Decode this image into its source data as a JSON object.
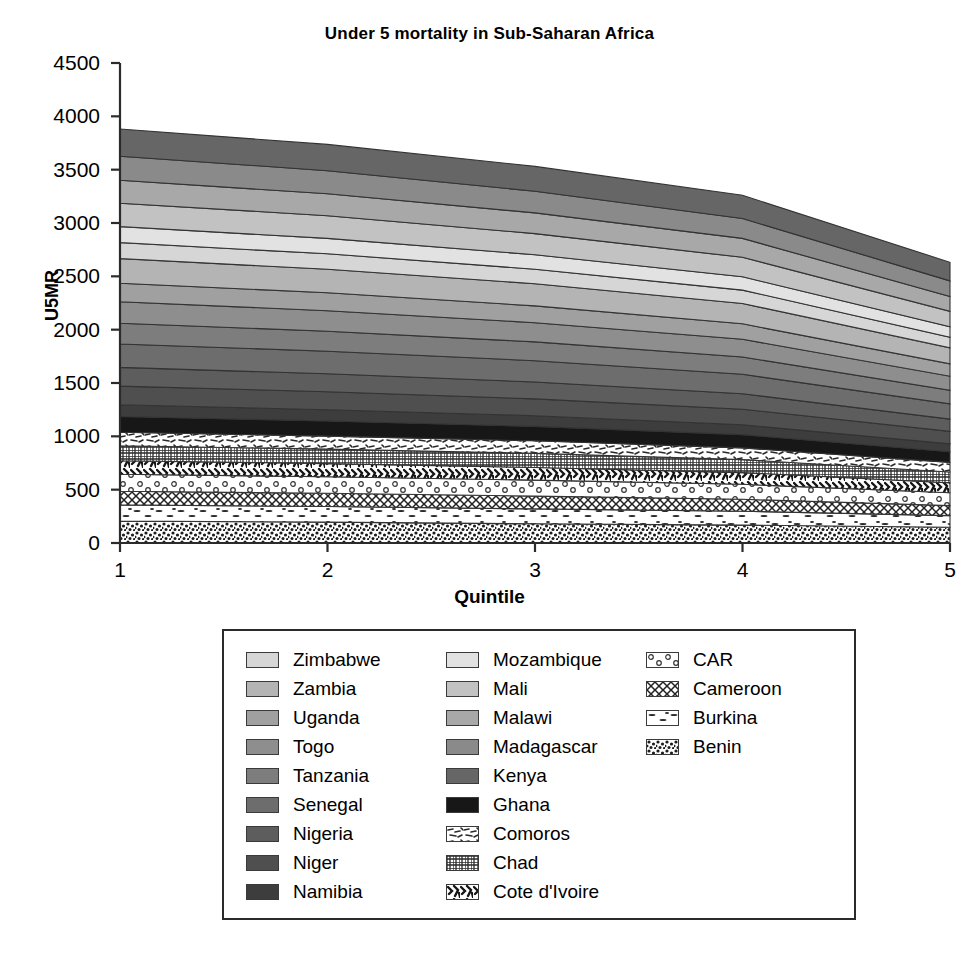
{
  "chart_data": {
    "type": "area",
    "title": "Under 5 mortality in Sub-Saharan Africa",
    "xlabel": "Quintile",
    "ylabel": "U5MR",
    "x": [
      1,
      2,
      3,
      4,
      5
    ],
    "xticklabels": [
      "1",
      "2",
      "3",
      "4",
      "5"
    ],
    "yticklabels": [
      "0",
      "500",
      "1000",
      "1500",
      "2000",
      "2500",
      "3000",
      "3500",
      "4000",
      "4500"
    ],
    "ylim": [
      0,
      4500
    ],
    "xlim": [
      1,
      5
    ],
    "ytick_step": 500,
    "grid": false,
    "legend_position": "below-plot",
    "stacked": true,
    "stack_order_bottom_to_top": [
      "Benin",
      "Burkina",
      "Cameroon",
      "CAR",
      "Cote d'Ivoire",
      "Chad",
      "Comoros",
      "Ghana",
      "Namibia",
      "Niger",
      "Nigeria",
      "Senegal",
      "Tanzania",
      "Togo",
      "Uganda",
      "Zambia",
      "Zimbabwe",
      "Mozambique",
      "Mali",
      "Malawi",
      "Madagascar",
      "Kenya"
    ],
    "series": [
      {
        "name": "Benin",
        "fill": "speckle-dense",
        "color": "#ffffff",
        "values": [
          205,
          196,
          180,
          168,
          147
        ]
      },
      {
        "name": "Burkina",
        "fill": "dash-sparse",
        "color": "#ffffff",
        "values": [
          152,
          146,
          140,
          130,
          110
        ]
      },
      {
        "name": "Cameroon",
        "fill": "crosshatch",
        "color": "#ffffff",
        "values": [
          128,
          124,
          120,
          112,
          94
        ]
      },
      {
        "name": "CAR",
        "fill": "circles",
        "color": "#ffffff",
        "values": [
          160,
          155,
          150,
          140,
          120
        ]
      },
      {
        "name": "Cote d'Ivoire",
        "fill": "squiggle-bold",
        "color": "#ffffff",
        "values": [
          127,
          123,
          118,
          110,
          93
        ]
      },
      {
        "name": "Chad",
        "fill": "grid-fine",
        "color": "#ffffff",
        "values": [
          140,
          136,
          132,
          122,
          102
        ]
      },
      {
        "name": "Comoros",
        "fill": "squiggle-light",
        "color": "#ffffff",
        "values": [
          126,
          122,
          118,
          110,
          90
        ]
      },
      {
        "name": "Ghana",
        "fill": "solid",
        "color": "#171717",
        "values": [
          148,
          142,
          135,
          124,
          100
        ]
      },
      {
        "name": "Namibia",
        "fill": "solid",
        "color": "#3d3d3d",
        "values": [
          110,
          106,
          100,
          92,
          74
        ]
      },
      {
        "name": "Niger",
        "fill": "solid",
        "color": "#4f4f4f",
        "values": [
          175,
          168,
          158,
          146,
          116
        ]
      },
      {
        "name": "Nigeria",
        "fill": "solid",
        "color": "#5d5d5d",
        "values": [
          175,
          168,
          158,
          146,
          116
        ]
      },
      {
        "name": "Senegal",
        "fill": "solid",
        "color": "#6d6d6d",
        "values": [
          220,
          212,
          200,
          182,
          142
        ]
      },
      {
        "name": "Tanzania",
        "fill": "solid",
        "color": "#7d7d7d",
        "values": [
          195,
          188,
          176,
          162,
          128
        ]
      },
      {
        "name": "Togo",
        "fill": "solid",
        "color": "#8e8e8e",
        "values": [
          200,
          192,
          180,
          166,
          132
        ]
      },
      {
        "name": "Uganda",
        "fill": "solid",
        "color": "#a0a0a0",
        "values": [
          175,
          168,
          158,
          145,
          115
        ]
      },
      {
        "name": "Zambia",
        "fill": "solid",
        "color": "#b4b4b4",
        "values": [
          230,
          220,
          208,
          190,
          150
        ]
      },
      {
        "name": "Zimbabwe",
        "fill": "solid",
        "color": "#d6d6d6",
        "values": [
          150,
          145,
          136,
          126,
          100
        ]
      },
      {
        "name": "Mozambique",
        "fill": "solid",
        "color": "#e2e2e2",
        "values": [
          150,
          145,
          136,
          125,
          98
        ]
      },
      {
        "name": "Mali",
        "fill": "solid",
        "color": "#c2c2c2",
        "values": [
          220,
          212,
          198,
          182,
          144
        ]
      },
      {
        "name": "Malawi",
        "fill": "solid",
        "color": "#a8a8a8",
        "values": [
          215,
          206,
          194,
          178,
          140
        ]
      },
      {
        "name": "Madagascar",
        "fill": "solid",
        "color": "#8a8a8a",
        "values": [
          225,
          216,
          202,
          186,
          146
        ]
      },
      {
        "name": "Kenya",
        "fill": "solid",
        "color": "#666666",
        "values": [
          255,
          247,
          234,
          218,
          175
        ]
      }
    ]
  },
  "axis": {
    "yticks": [
      "4500",
      "4000",
      "3500",
      "3000",
      "2500",
      "2000",
      "1500",
      "1000",
      "500",
      "0"
    ],
    "xticks": [
      "1",
      "2",
      "3",
      "4",
      "5"
    ]
  },
  "legend": {
    "columns": [
      {
        "items": [
          {
            "label": "Zimbabwe",
            "key": "Zimbabwe"
          },
          {
            "label": "Zambia",
            "key": "Zambia"
          },
          {
            "label": "Uganda",
            "key": "Uganda"
          },
          {
            "label": "Togo",
            "key": "Togo"
          },
          {
            "label": "Tanzania",
            "key": "Tanzania"
          },
          {
            "label": "Senegal",
            "key": "Senegal"
          },
          {
            "label": "Nigeria",
            "key": "Nigeria"
          },
          {
            "label": "Niger",
            "key": "Niger"
          },
          {
            "label": "Namibia",
            "key": "Namibia"
          }
        ]
      },
      {
        "items": [
          {
            "label": "Mozambique",
            "key": "Mozambique"
          },
          {
            "label": "Mali",
            "key": "Mali"
          },
          {
            "label": "Malawi",
            "key": "Malawi"
          },
          {
            "label": "Madagascar",
            "key": "Madagascar"
          },
          {
            "label": "Kenya",
            "key": "Kenya"
          },
          {
            "label": "Ghana",
            "key": "Ghana"
          },
          {
            "label": "Comoros",
            "key": "Comoros"
          },
          {
            "label": "Chad",
            "key": "Chad"
          },
          {
            "label": "Cote d'Ivoire",
            "key": "Cote d'Ivoire"
          }
        ]
      },
      {
        "items": [
          {
            "label": "CAR",
            "key": "CAR"
          },
          {
            "label": "Cameroon",
            "key": "Cameroon"
          },
          {
            "label": "Burkina",
            "key": "Burkina"
          },
          {
            "label": "Benin",
            "key": "Benin"
          }
        ]
      }
    ]
  },
  "colors": {
    "axis": "#2b2b2b",
    "text": "#000000",
    "background": "#ffffff",
    "stroke": "#3a3a3a"
  }
}
